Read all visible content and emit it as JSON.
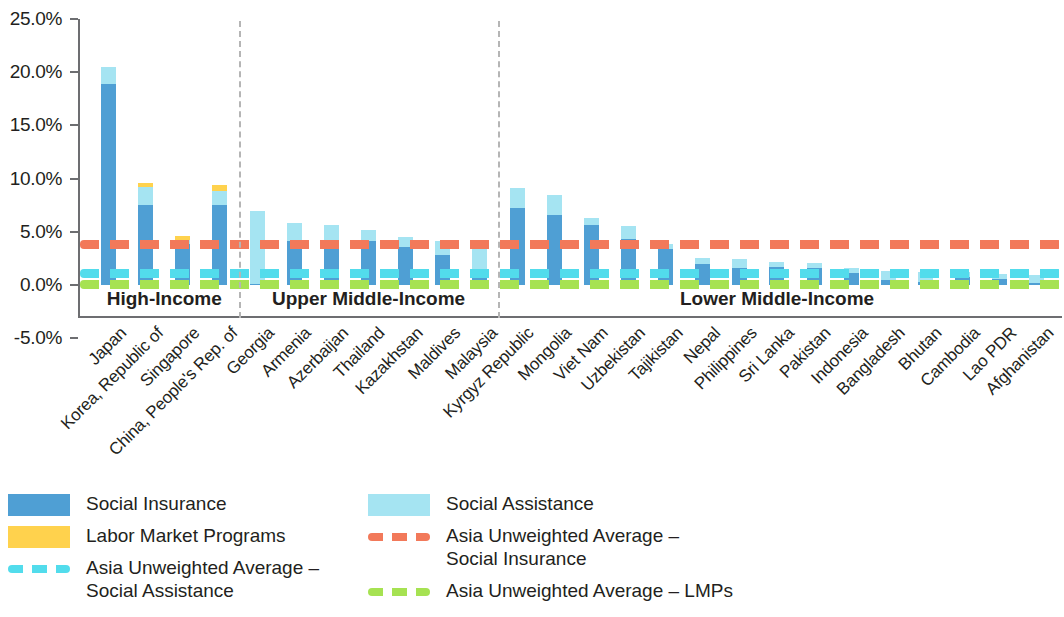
{
  "chart_data": {
    "type": "bar",
    "title": "",
    "subtitle": "",
    "xlabel": "",
    "ylabel": "",
    "stacked": true,
    "grid": false,
    "legend_position": "bottom",
    "ylim": [
      -5.0,
      25.0
    ],
    "ytick_labels": [
      "25.0%",
      "20.0%",
      "15.0%",
      "10.0%",
      "5.0%",
      "0.0%",
      "-5.0%"
    ],
    "ytick_values": [
      25.0,
      20.0,
      15.0,
      10.0,
      5.0,
      0.0,
      -5.0
    ],
    "categories": [
      "Japan",
      "Korea, Republic of",
      "Singapore",
      "China, People's Rep. of",
      "Georgia",
      "Armenia",
      "Azerbaijan",
      "Thailand",
      "Kazakhstan",
      "Maldives",
      "Malaysia",
      "Kyrgyz Republic",
      "Mongolia",
      "Viet Nam",
      "Uzbekistan",
      "Tajikistan",
      "Nepal",
      "Philippines",
      "Sri Lanka",
      "Pakistan",
      "Indonesia",
      "Bangladesh",
      "Bhutan",
      "Cambodia",
      "Lao PDR",
      "Afghanistan"
    ],
    "series": [
      {
        "name": "Social Insurance",
        "color": "#4f9fd4",
        "values": [
          18.9,
          7.5,
          3.9,
          7.5,
          0.1,
          4.1,
          4.0,
          4.1,
          3.6,
          2.8,
          1.4,
          7.2,
          6.6,
          5.6,
          4.3,
          3.4,
          2.0,
          1.6,
          1.7,
          1.6,
          1.1,
          0.5,
          0.3,
          0.8,
          0.6,
          0.2
        ]
      },
      {
        "name": "Social Assistance",
        "color": "#a5e4f2",
        "values": [
          1.6,
          1.7,
          0.3,
          1.3,
          6.9,
          1.7,
          1.6,
          1.1,
          0.9,
          1.3,
          2.3,
          1.9,
          1.9,
          0.7,
          1.2,
          0.5,
          0.5,
          0.8,
          0.5,
          0.5,
          0.5,
          0.8,
          0.9,
          0.4,
          0.4,
          0.7
        ]
      },
      {
        "name": "Labor Market Programs",
        "color": "#ffd24d",
        "values": [
          0.0,
          0.4,
          0.4,
          0.6,
          0.0,
          0.0,
          0.0,
          0.0,
          0.0,
          0.0,
          0.0,
          0.0,
          0.0,
          0.0,
          0.0,
          0.0,
          0.0,
          0.0,
          0.0,
          0.0,
          0.0,
          0.0,
          0.0,
          0.0,
          0.0,
          0.0
        ]
      }
    ],
    "reference_lines": [
      {
        "name": "Asia Unweighted Average - Social Insurance",
        "value": 3.9,
        "color": "#f2795a",
        "style": "dashed"
      },
      {
        "name": "Asia Unweighted Average - Social Assistance",
        "value": 1.1,
        "color": "#52dcec",
        "style": "dashed"
      },
      {
        "name": "Asia Unweighted Average - LMPs",
        "value": 0.1,
        "color": "#a6e252",
        "style": "dashed"
      }
    ],
    "groups": [
      {
        "label": "High-Income",
        "start": 0,
        "end": 3
      },
      {
        "label": "Upper Middle-Income",
        "start": 4,
        "end": 10
      },
      {
        "label": "Lower Middle-Income",
        "start": 11,
        "end": 25
      }
    ]
  },
  "legend": {
    "items": [
      {
        "label": "Social Insurance",
        "swatch": "box",
        "color": "#4f9fd4"
      },
      {
        "label": "Labor Market Programs",
        "swatch": "box",
        "color": "#ffd24d"
      },
      {
        "label": "Asia Unweighted Average –\nSocial Assistance",
        "swatch": "dash",
        "color": "#52dcec"
      },
      {
        "label": "Social Assistance",
        "swatch": "box",
        "color": "#a5e4f2"
      },
      {
        "label": "Asia Unweighted Average –\nSocial Insurance",
        "swatch": "dash",
        "color": "#f2795a"
      },
      {
        "label": "Asia Unweighted Average – LMPs",
        "swatch": "dash",
        "color": "#a6e252"
      }
    ]
  }
}
